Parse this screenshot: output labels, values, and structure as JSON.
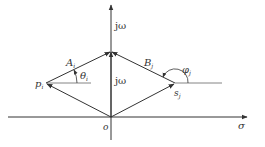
{
  "diagram": {
    "axes": {
      "real_label": "σ",
      "imag_label": "jω",
      "origin_label": "o"
    },
    "labels": {
      "pole": "p",
      "pole_sub": "i",
      "zero": "s",
      "zero_sub": "j",
      "vector_A": "A",
      "vector_A_sub": "i",
      "vector_B": "B",
      "vector_B_sub": "j",
      "angle_theta": "θ",
      "angle_theta_sub": "i",
      "angle_phi": "φ",
      "angle_phi_sub": "j",
      "jw_vector": "jω"
    },
    "colors": {
      "line": "#333333"
    }
  }
}
